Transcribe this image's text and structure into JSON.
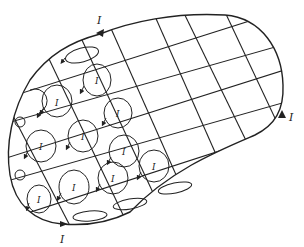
{
  "diagram": {
    "title": "",
    "colors": {
      "stroke": "#222222",
      "background": "#ffffff"
    },
    "boundary_labels": [
      {
        "text": "I",
        "x": 97,
        "y": 24
      },
      {
        "text": "I",
        "x": 289,
        "y": 121
      },
      {
        "text": "I",
        "x": 60,
        "y": 243
      }
    ],
    "loop_labels": [
      {
        "text": "I",
        "x": 97,
        "y": 82
      },
      {
        "text": "I",
        "x": 57,
        "y": 104
      },
      {
        "text": "I",
        "x": 118,
        "y": 114
      },
      {
        "text": "I",
        "x": 41,
        "y": 147
      },
      {
        "text": "I",
        "x": 83,
        "y": 136
      },
      {
        "text": "I",
        "x": 124,
        "y": 152
      },
      {
        "text": "I",
        "x": 39,
        "y": 199
      },
      {
        "text": "I",
        "x": 74,
        "y": 188
      },
      {
        "text": "I",
        "x": 113,
        "y": 178
      },
      {
        "text": "I",
        "x": 154,
        "y": 166
      }
    ]
  }
}
